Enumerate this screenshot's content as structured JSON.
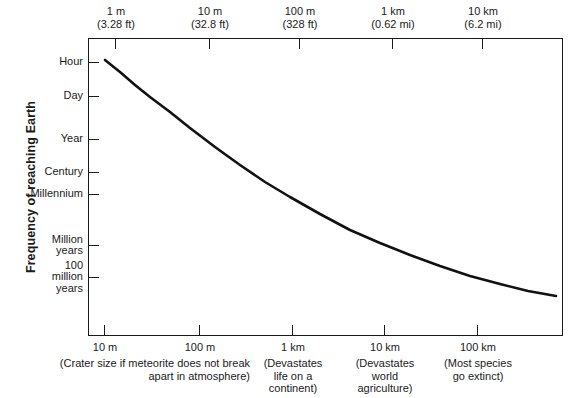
{
  "chart_data": {
    "type": "line",
    "title": "",
    "xlabel": "",
    "ylabel": "Frequency of reaching Earth",
    "grid": false,
    "legend": "none",
    "x_axis_bottom": {
      "name": "Crater diameter",
      "ticks": [
        "10 m",
        "100 m",
        "1 km",
        "10 km",
        "100 km"
      ],
      "tick_positions_px": [
        105,
        200,
        293,
        385,
        478
      ],
      "notes": [
        "(Crater size if meteorite does not break\napart in atmosphere)",
        "(Devastates\nlife on a\ncontinent)",
        "(Devastates\nworld\nagriculture)",
        "(Most species\ngo extinct)"
      ]
    },
    "x_axis_top": {
      "name": "Meteorite diameter",
      "ticks": [
        {
          "metric": "1 m",
          "imperial": "(3.28 ft)"
        },
        {
          "metric": "10 m",
          "imperial": "(32.8 ft)"
        },
        {
          "metric": "100 m",
          "imperial": "(328 ft)"
        },
        {
          "metric": "1 km",
          "imperial": "(0.62 mi)"
        },
        {
          "metric": "10 km",
          "imperial": "(6.2 mi)"
        }
      ],
      "tick_positions_px": [
        116,
        210,
        300,
        393,
        483
      ]
    },
    "y_axis": {
      "name": "Frequency of reaching Earth",
      "ticks": [
        "Hour",
        "Day",
        "Year",
        "Century",
        "Millennium",
        "Million\nyears",
        "100\nmillion\nyears"
      ],
      "tick_positions_px": [
        63,
        97,
        140,
        173,
        195,
        246,
        278
      ]
    },
    "series": [
      {
        "name": "Impact frequency",
        "color": "#111111",
        "points_px": [
          [
            105,
            60
          ],
          [
            120,
            72
          ],
          [
            135,
            85
          ],
          [
            150,
            97
          ],
          [
            170,
            112
          ],
          [
            190,
            128
          ],
          [
            215,
            147
          ],
          [
            240,
            165
          ],
          [
            265,
            182
          ],
          [
            290,
            197
          ],
          [
            320,
            214
          ],
          [
            350,
            230
          ],
          [
            380,
            243
          ],
          [
            410,
            255
          ],
          [
            440,
            266
          ],
          [
            470,
            276
          ],
          [
            500,
            284
          ],
          [
            528,
            291
          ],
          [
            556,
            296
          ]
        ]
      }
    ]
  },
  "layout": {
    "plot": {
      "left": 88,
      "top": 38,
      "width": 475,
      "height": 298
    },
    "curve_color": "#111111",
    "axis_color": "#1a1a1a",
    "background": "#ffffff"
  }
}
